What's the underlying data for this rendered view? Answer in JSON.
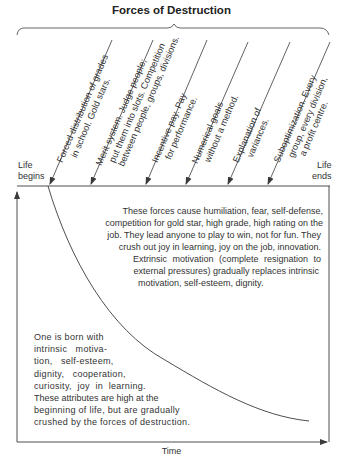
{
  "title": "Forces of Destruction",
  "forces": [
    {
      "lines": [
        "Forced distribution of grades",
        "in school. Gold stars."
      ]
    },
    {
      "lines": [
        "Merit system.  Judge people;",
        "put them into slots.  Competition",
        "between people, groups, divisions."
      ]
    },
    {
      "lines": [
        "Incentive pay.   Pay",
        "for performance."
      ]
    },
    {
      "lines": [
        "Numerical goals",
        "without a method."
      ]
    },
    {
      "lines": [
        "Explanation of",
        "variances."
      ]
    },
    {
      "lines": [
        "Suboptimization.  Every",
        "group, every division,",
        "a profit centre."
      ]
    }
  ],
  "axis": {
    "life_begins": [
      "Life",
      "begins"
    ],
    "life_ends": [
      "Life",
      "ends"
    ],
    "x_label": "Time"
  },
  "upper_text": [
    "These forces cause humiliation, fear, self-defense,",
    "competition for gold star,  high grade, high rating on the",
    "job. They lead  anyone to play to win, not for fun. They",
    "crush out joy in learning, joy on the job, innovation.",
    "Extrinsic motivation (complete resignation to",
    "external pressures) gradually replaces intrinsic",
    "motivation, self-esteem, dignity."
  ],
  "lower_text": [
    "One is born with",
    "intrinsic   motiva-",
    "tion,   self-esteem,",
    "dignity,   cooperation,",
    "curiosity,  joy  in  learning.",
    "These attributes are high at the",
    "beginning of life, but are gradually",
    "crushed by the forces of destruction."
  ],
  "colors": {
    "line": "#3a3a3a",
    "text": "#333333",
    "background": "#ffffff"
  }
}
